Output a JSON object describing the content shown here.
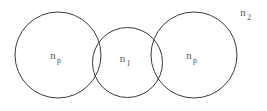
{
  "figure": {
    "background_color": "#ffffff",
    "stroke_color": "#3a3a3a",
    "text_color": "#555555",
    "width": 267,
    "height": 111
  },
  "labels": {
    "left_circle": {
      "base": "n",
      "sub": "p"
    },
    "middle_circle": {
      "base": "n",
      "sub": "1"
    },
    "right_circle": {
      "base": "n",
      "sub": "p"
    },
    "outside_medium": {
      "base": "n",
      "sub": "2"
    }
  },
  "chart_data": {
    "type": "diagram",
    "shape": "circle",
    "title": "",
    "xlabel": "",
    "ylabel": "",
    "xlim": [
      0,
      267
    ],
    "ylim": [
      0,
      111
    ],
    "grid": false,
    "legend": "none",
    "circles": [
      {
        "id": "left-large-circle",
        "label_base": "n",
        "label_sub": "p",
        "cx": 58,
        "cy": 55,
        "r": 43,
        "label_x": 58,
        "label_y": 59
      },
      {
        "id": "middle-small-circle",
        "label_base": "n",
        "label_sub": "1",
        "cx": 127.5,
        "cy": 62.5,
        "r": 35,
        "label_x": 127.5,
        "label_y": 62
      },
      {
        "id": "right-large-circle",
        "label_base": "n",
        "label_sub": "p",
        "cx": 194,
        "cy": 55,
        "r": 43,
        "label_x": 194,
        "label_y": 59
      }
    ],
    "annotations": [
      {
        "id": "outside-medium-label",
        "label_base": "n",
        "label_sub": "2",
        "x": 243,
        "y": 16
      }
    ]
  }
}
